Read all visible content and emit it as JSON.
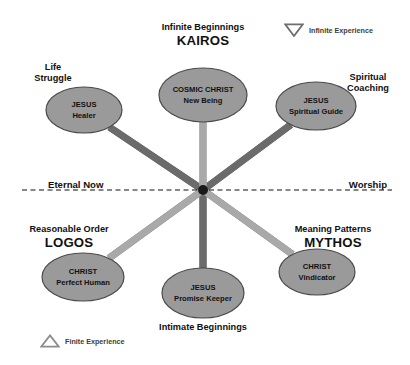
{
  "figure": {
    "background_color": "#ffffff",
    "node_fill": "#9a9a9a",
    "node_stroke": "#4a4a4a",
    "edge_dark": "#6b6b6b",
    "edge_light": "#a9a9a9",
    "hub_color": "#1a1a1a",
    "axis_color": "#111111"
  },
  "nodes": [
    {
      "id": "cosmic-christ",
      "line1": "COSMIC CHRIST",
      "line2": "New Being",
      "cx": 203,
      "cy": 95,
      "rx": 44,
      "ry": 27
    },
    {
      "id": "jesus-healer",
      "line1": "JESUS",
      "line2": "Healer",
      "cx": 84,
      "cy": 110,
      "rx": 38,
      "ry": 23
    },
    {
      "id": "jesus-guide",
      "line1": "JESUS",
      "line2": "Spiritual Guide",
      "cx": 316,
      "cy": 106,
      "rx": 40,
      "ry": 24
    },
    {
      "id": "christ-human",
      "line1": "CHRIST",
      "line2": "Perfect Human",
      "cx": 83,
      "cy": 277,
      "rx": 41,
      "ry": 24
    },
    {
      "id": "jesus-promise",
      "line1": "JESUS",
      "line2": "Promise Keeper",
      "cx": 203,
      "cy": 293,
      "rx": 41,
      "ry": 25
    },
    {
      "id": "christ-vind",
      "line1": "CHRIST",
      "line2": "Vindicator",
      "cx": 317,
      "cy": 272,
      "rx": 38,
      "ry": 23
    }
  ],
  "hub": {
    "cx": 203,
    "cy": 190,
    "r": 5
  },
  "edges": [
    {
      "from": "jesus-healer",
      "to": "christ-vind",
      "shade": "dark"
    },
    {
      "from": "jesus-guide",
      "to": "christ-human",
      "shade": "dark"
    },
    {
      "from": "cosmic-christ",
      "to": "jesus-promise",
      "shade": "light"
    },
    {
      "from": "jesus-healer",
      "to": "jesus-promise",
      "shade": "dark"
    },
    {
      "from": "jesus-guide",
      "to": "jesus-promise",
      "shade": "dark"
    },
    {
      "from": "cosmic-christ",
      "to": "christ-human",
      "shade": "light"
    },
    {
      "from": "cosmic-christ",
      "to": "christ-vind",
      "shade": "light"
    }
  ],
  "axis": {
    "left_label": "Eternal Now",
    "right_label": "Worship",
    "y": 190,
    "x_start": 22,
    "x_end": 392
  },
  "poles": {
    "top": {
      "sub": "Infinite Beginnings",
      "main": "KAIROS"
    },
    "bottom": {
      "sub": "Intimate Beginnings",
      "main": ""
    },
    "left": {
      "sub": "Reasonable Order",
      "main": "LOGOS"
    },
    "right": {
      "sub": "Meaning Patterns",
      "main": "MYTHOS"
    }
  },
  "corner_labels": {
    "top_left": "Life\nStruggle",
    "top_left_1": "Life",
    "top_left_2": "Struggle",
    "top_right_1": "Spiritual",
    "top_right_2": "Coaching"
  },
  "legends": [
    {
      "id": "infinite",
      "label": "Infinite Experience",
      "icon": "triangle-down-icon",
      "x": 284,
      "y": 23
    },
    {
      "id": "finite",
      "label": "Finite Experience",
      "icon": "triangle-up-icon",
      "x": 40,
      "y": 334
    }
  ]
}
